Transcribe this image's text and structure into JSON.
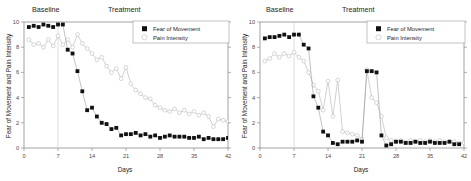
{
  "figure": {
    "panel_count": 2,
    "background": "#ffffff"
  },
  "chart_data": [
    {
      "type": "line",
      "panel": "left",
      "title": "",
      "xlabel": "Days",
      "ylabel": "Fear of Movement and Pain Intensity",
      "xlim": [
        0,
        42
      ],
      "ylim": [
        0,
        10
      ],
      "xticks": [
        0,
        7,
        14,
        21,
        28,
        35,
        42
      ],
      "yticks": [
        0,
        2,
        4,
        6,
        8,
        10
      ],
      "grid": false,
      "legend_position": "top-right",
      "annotations": [
        {
          "text": "Baseline",
          "x": 3.5,
          "y": 10.9
        },
        {
          "text": "Treatment",
          "x": 22,
          "y": 10.9
        }
      ],
      "phase_divider_x": 7,
      "series": [
        {
          "name": "Fear of Movement",
          "marker": "filled-square",
          "color": "#111111",
          "x": [
            1,
            2,
            3,
            4,
            5,
            6,
            7,
            8,
            9,
            10,
            11,
            12,
            13,
            14,
            15,
            16,
            17,
            18,
            19,
            20,
            21,
            22,
            23,
            24,
            25,
            26,
            27,
            28,
            29,
            30,
            31,
            32,
            33,
            34,
            35,
            36,
            37,
            38,
            39,
            40,
            41,
            42
          ],
          "values": [
            9.6,
            9.7,
            9.6,
            9.8,
            9.7,
            9.6,
            9.8,
            9.8,
            7.8,
            7.5,
            6.1,
            4.5,
            3.0,
            3.2,
            2.5,
            2.0,
            1.9,
            1.5,
            1.6,
            1.0,
            1.1,
            1.1,
            1.2,
            1.0,
            1.1,
            0.9,
            1.0,
            0.8,
            0.9,
            1.0,
            0.9,
            0.9,
            0.9,
            0.8,
            0.8,
            0.9,
            0.7,
            0.8,
            0.7,
            0.7,
            0.7,
            0.8
          ]
        },
        {
          "name": "Pain Intensity",
          "marker": "open-circle",
          "color": "#bdbdbd",
          "x": [
            1,
            2,
            3,
            4,
            5,
            6,
            7,
            8,
            9,
            10,
            11,
            12,
            13,
            14,
            15,
            16,
            17,
            18,
            19,
            20,
            21,
            22,
            23,
            24,
            25,
            26,
            27,
            28,
            29,
            30,
            31,
            32,
            33,
            34,
            35,
            36,
            37,
            38,
            39,
            40,
            41,
            42
          ],
          "values": [
            8.6,
            8.2,
            8.3,
            8.0,
            8.6,
            8.1,
            8.9,
            8.2,
            8.6,
            8.0,
            9.0,
            8.3,
            7.9,
            7.5,
            7.0,
            7.2,
            6.5,
            6.0,
            6.3,
            5.5,
            6.4,
            5.1,
            4.6,
            4.3,
            4.0,
            3.9,
            3.4,
            3.2,
            3.0,
            2.9,
            3.1,
            2.8,
            3.0,
            2.7,
            2.9,
            2.6,
            2.8,
            2.5,
            1.7,
            2.3,
            2.2,
            2.1
          ]
        }
      ]
    },
    {
      "type": "line",
      "panel": "right",
      "title": "",
      "xlabel": "Days",
      "ylabel": "Fear of Movement and Pain Intensity",
      "xlim": [
        0,
        42
      ],
      "ylim": [
        0,
        10
      ],
      "xticks": [
        0,
        7,
        14,
        21,
        28,
        35,
        42
      ],
      "yticks": [
        0,
        2,
        4,
        6,
        8,
        10
      ],
      "grid": false,
      "legend_position": "top-right",
      "annotations": [
        {
          "text": "Baseline",
          "x": 3.5,
          "y": 10.9
        },
        {
          "text": "Treatment",
          "x": 22,
          "y": 10.9
        }
      ],
      "phase_divider_x": 7,
      "series": [
        {
          "name": "Fear of Movement",
          "marker": "filled-square",
          "color": "#111111",
          "x": [
            1,
            2,
            3,
            4,
            5,
            6,
            7,
            8,
            9,
            10,
            11,
            12,
            13,
            14,
            15,
            16,
            17,
            18,
            19,
            20,
            21,
            22,
            23,
            24,
            25,
            26,
            27,
            28,
            29,
            30,
            31,
            32,
            33,
            34,
            35,
            36,
            37,
            38,
            39,
            40,
            41
          ],
          "values": [
            8.7,
            8.8,
            8.8,
            8.9,
            9.0,
            8.8,
            9.0,
            9.0,
            8.2,
            7.9,
            4.1,
            3.2,
            1.3,
            1.0,
            0.4,
            0.3,
            0.5,
            0.5,
            0.5,
            0.6,
            0.5,
            6.1,
            6.1,
            6.0,
            1.0,
            0.2,
            0.3,
            0.5,
            0.5,
            0.4,
            0.4,
            0.5,
            0.4,
            0.4,
            0.5,
            0.4,
            0.4,
            0.4,
            0.5,
            0.3,
            0.3
          ]
        },
        {
          "name": "Pain Intensity",
          "marker": "open-circle",
          "color": "#bdbdbd",
          "x": [
            1,
            2,
            3,
            4,
            5,
            6,
            7,
            8,
            9,
            10,
            11,
            12,
            13,
            14,
            15,
            16,
            17,
            18,
            19,
            20,
            21,
            22,
            23,
            24,
            25,
            26,
            27,
            28,
            29,
            30,
            31,
            32,
            33,
            34,
            35,
            36,
            37,
            38,
            39,
            40,
            41,
            42
          ],
          "values": [
            6.9,
            7.1,
            7.5,
            7.2,
            7.5,
            7.3,
            7.6,
            7.2,
            6.9,
            6.0,
            5.0,
            4.5,
            3.0,
            5.3,
            2.5,
            5.4,
            1.3,
            1.2,
            1.1,
            1.0,
            0.7,
            6.2,
            4.0,
            3.6,
            2.5,
            0.8,
            0.6,
            0.5,
            0.6,
            0.5,
            0.6,
            0.5,
            0.6,
            0.5,
            0.6,
            0.5,
            0.6,
            0.5,
            0.5,
            0.5,
            0.4,
            0.4
          ]
        }
      ]
    }
  ]
}
